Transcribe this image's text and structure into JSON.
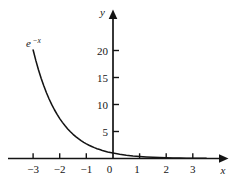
{
  "chart_data": {
    "type": "line",
    "title": "",
    "subtitle": "",
    "xlabel": "x",
    "ylabel": "y",
    "xlim": [
      -3.9,
      4.3
    ],
    "ylim": [
      -1.2,
      23.0
    ],
    "grid": false,
    "legend_position": "none",
    "x_ticks": [
      -3,
      -2,
      -1,
      0,
      1,
      2,
      3
    ],
    "x_tick_labels": [
      "−3",
      "−2",
      "−1",
      "0",
      "1",
      "2",
      "3"
    ],
    "y_ticks": [
      5,
      10,
      15,
      20
    ],
    "y_tick_labels": [
      "5",
      "10",
      "15",
      "20"
    ],
    "annotations": [
      {
        "name": "curve-label",
        "base": "e",
        "exponent": "−x",
        "full_text": "e^−x",
        "x": -3.0,
        "y": 21.5
      }
    ],
    "series": [
      {
        "name": "e^-x",
        "function": "y = e^(-x)",
        "color": "#141414",
        "x": [
          -3.0,
          -2.9,
          -2.8,
          -2.7,
          -2.6,
          -2.5,
          -2.4,
          -2.3,
          -2.2,
          -2.1,
          -2.0,
          -1.9,
          -1.8,
          -1.7,
          -1.6,
          -1.5,
          -1.4,
          -1.3,
          -1.2,
          -1.1,
          -1.0,
          -0.9,
          -0.8,
          -0.7,
          -0.6,
          -0.5,
          -0.4,
          -0.3,
          -0.2,
          -0.1,
          0.0,
          0.25,
          0.5,
          0.75,
          1.0,
          1.25,
          1.5,
          1.75,
          2.0,
          2.25,
          2.5,
          2.75,
          3.0,
          3.25,
          3.5
        ],
        "values": [
          20.09,
          18.17,
          16.44,
          14.88,
          13.46,
          12.18,
          11.02,
          9.97,
          9.03,
          8.17,
          7.39,
          6.69,
          6.05,
          5.47,
          4.95,
          4.48,
          4.06,
          3.67,
          3.32,
          3.0,
          2.72,
          2.46,
          2.23,
          2.01,
          1.82,
          1.65,
          1.49,
          1.35,
          1.22,
          1.11,
          1.0,
          0.78,
          0.61,
          0.47,
          0.37,
          0.29,
          0.22,
          0.17,
          0.14,
          0.11,
          0.08,
          0.06,
          0.05,
          0.04,
          0.03
        ]
      }
    ]
  },
  "axes": {
    "y_axis_name": "y",
    "x_axis_name": "x"
  },
  "colors": {
    "ink": "#141414",
    "background": "#ffffff"
  }
}
